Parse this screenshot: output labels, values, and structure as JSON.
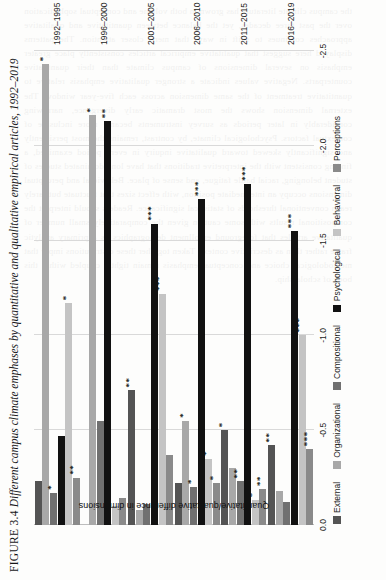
{
  "caption": {
    "figure_number": "FIGURE 3.4",
    "text": "Different campus climate emphases by quantitative and qualitative empirical articles, 1992–2019"
  },
  "ghost_text": "the campus climate literature has grown in both volume and conceptual sophistication over the past three decades, yet the balance between quantitative and qualitative approaches continues to shift in ways that merit closer attention. The patterns displayed here suggest that qualitative empirical articles consistently place greater emphasis on several dimensions of campus climate than their quantitative counterparts. Negative values indicate a stronger qualitative emphasis relative to quantitative treatment of the same dimension across each five-year window. The external dimension shows the most dramatic early divergence, narrowing considerably in later periods as survey instruments became more inclusive of contextual factors. Psychological climate, by contrast, remains the most persistently and significantly skewed toward qualitative inquiry in every period examined, a finding consistent with the interpretive traditions that have long dominated studies of student belonging, racial battle fatigue, and sense of place. Behavioral and perceptual dimensions occupy an intermediate position, with effect sizes that fluctuate but rarely reach conventional thresholds of statistical significance. Readers should interpret the compositional results with some caution given the comparatively small number of qualitative articles that foreground enrollment demographics as a primary analytic frame rather than as descriptive context. Taken together these distributions imply that methodological choice and conceptual emphasis remain tightly coupled within this body of scholarship.",
  "legend": {
    "items": [
      {
        "label": "External",
        "color": "#545454"
      },
      {
        "label": "Organizational",
        "color": "#a8a8a8"
      },
      {
        "label": "Compositional",
        "color": "#707070"
      },
      {
        "label": "Psychological",
        "color": "#111111"
      },
      {
        "label": "Behavioral",
        "color": "#c4c4c4"
      },
      {
        "label": "Perceptions",
        "color": "#8a8a8a"
      }
    ]
  },
  "chart_data": {
    "type": "bar",
    "orientation": "horizontal",
    "title": "Different campus climate emphases by quantitative and qualitative empirical articles, 1992–2019",
    "xlabel": "",
    "ylabel": "Quantitative/qualitative difference in dimensions",
    "value_axis_range": [
      0.0,
      -2.5
    ],
    "value_axis_ticks": [
      "0.0",
      "-0.5",
      "-1.0",
      "-1.5",
      "-2.0",
      "-2.5"
    ],
    "value_axis_tick_values": [
      0.0,
      -0.5,
      -1.0,
      -1.5,
      -2.0,
      -2.5
    ],
    "grid": true,
    "legend_position": "bottom",
    "categories": [
      "1992–1995",
      "1996–2000",
      "2001–2005",
      "2006–2010",
      "2011–2015",
      "2016–2019"
    ],
    "series": [
      {
        "name": "External",
        "color": "#545454",
        "values": [
          -0.23,
          0.0,
          -0.71,
          -0.22,
          -0.5,
          -0.42
        ],
        "significance": [
          "",
          "",
          "**",
          "",
          "*",
          "**"
        ]
      },
      {
        "name": "Organizational",
        "color": "#a8a8a8",
        "values": [
          -2.43,
          -2.16,
          -0.08,
          -0.55,
          -0.3,
          -0.18
        ],
        "significance": [
          "*",
          "*",
          "",
          "*",
          "",
          ""
        ]
      },
      {
        "name": "Compositional",
        "color": "#707070",
        "values": [
          -0.17,
          -0.55,
          -0.11,
          -0.2,
          -0.23,
          -0.12
        ],
        "significance": [
          "*",
          "",
          "",
          "*",
          "**",
          ""
        ]
      },
      {
        "name": "Psychological",
        "color": "#111111",
        "values": [
          -0.47,
          -2.13,
          -1.59,
          -1.72,
          -1.8,
          -1.55
        ],
        "significance": [
          "",
          "**",
          "***",
          "***",
          "***",
          "***"
        ]
      },
      {
        "name": "Behavioral",
        "color": "#c4c4c4",
        "values": [
          -1.17,
          -0.1,
          -1.22,
          -0.35,
          -0.13,
          -1.0
        ],
        "significance": [
          "*",
          "",
          "***",
          "*",
          "*",
          "***"
        ]
      },
      {
        "name": "Perceptions",
        "color": "#8a8a8a",
        "values": [
          -0.25,
          -0.14,
          -0.37,
          -0.22,
          -0.19,
          -0.4
        ],
        "significance": [
          "**",
          "",
          "",
          "*",
          "**",
          "***"
        ]
      }
    ]
  }
}
